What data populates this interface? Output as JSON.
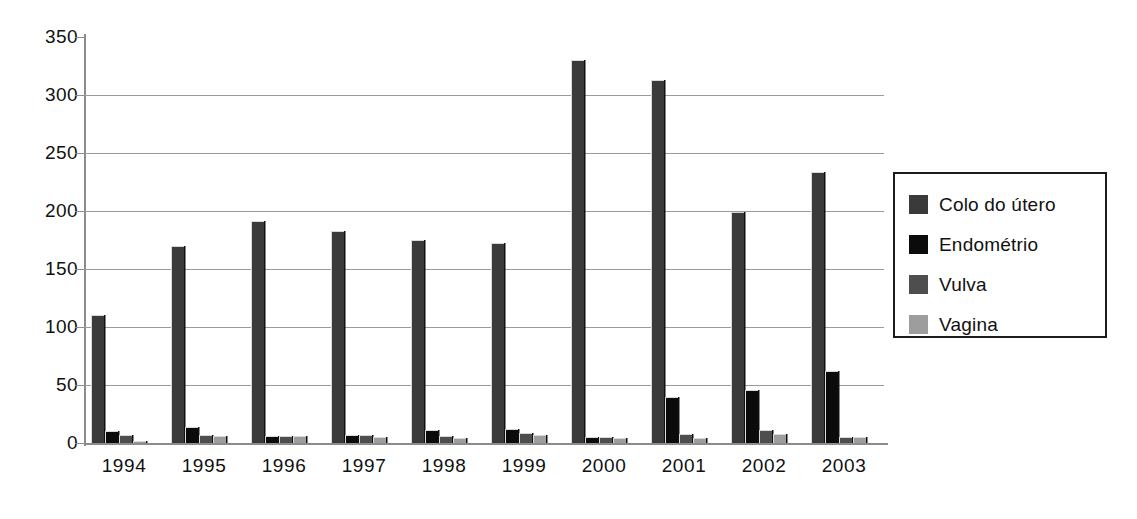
{
  "chart_data": {
    "type": "bar",
    "title": "",
    "subtitle": "",
    "xlabel": "",
    "ylabel": "",
    "categories": [
      "1994",
      "1995",
      "1996",
      "1997",
      "1998",
      "1999",
      "2000",
      "2001",
      "2002",
      "2003"
    ],
    "ylim": [
      0,
      350
    ],
    "ytick_labels": [
      "350",
      "300",
      "250",
      "200",
      "150",
      "100",
      "50",
      "0"
    ],
    "ytick_values": [
      350,
      300,
      250,
      200,
      150,
      100,
      50,
      0
    ],
    "ytick_step": 50,
    "grid": true,
    "grid_axis": "y",
    "legend_position": "right",
    "series": [
      {
        "name": "Colo do útero",
        "color": "#3a3a3a",
        "values": [
          110,
          170,
          191,
          183,
          175,
          172,
          330,
          313,
          199,
          234
        ]
      },
      {
        "name": "Endométrio",
        "color": "#0b0b0b",
        "values": [
          10,
          14,
          6,
          7,
          11,
          12,
          5,
          40,
          46,
          62
        ]
      },
      {
        "name": "Vulva",
        "color": "#4e4e4e",
        "values": [
          7,
          7,
          6,
          7,
          6,
          9,
          5,
          8,
          11,
          5
        ]
      },
      {
        "name": "Vagina",
        "color": "#9d9d9d",
        "values": [
          2,
          6,
          6,
          5,
          4,
          7,
          4,
          4,
          8,
          5
        ]
      }
    ]
  },
  "legend": {
    "items": [
      {
        "label": "Colo do útero",
        "color": "#3a3a3a"
      },
      {
        "label": "Endométrio",
        "color": "#0b0b0b"
      },
      {
        "label": "Vulva",
        "color": "#4e4e4e"
      },
      {
        "label": "Vagina",
        "color": "#9d9d9d"
      }
    ]
  }
}
